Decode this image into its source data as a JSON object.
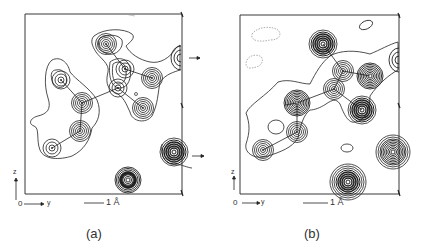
{
  "figure": {
    "panels": [
      {
        "id": "a",
        "caption": "(a)",
        "axis_origin_label": "0",
        "axis_horizontal_label": "y",
        "axis_vertical_label": "z",
        "scale_bar_label": "1 Å"
      },
      {
        "id": "b",
        "caption": "(b)",
        "axis_origin_label": "0",
        "axis_horizontal_label": "y",
        "axis_vertical_label": "z",
        "scale_bar_label": "1 Å"
      }
    ],
    "colors": {
      "ink": "#222222",
      "dashed_contour": "#999999",
      "background": "#ffffff"
    }
  }
}
